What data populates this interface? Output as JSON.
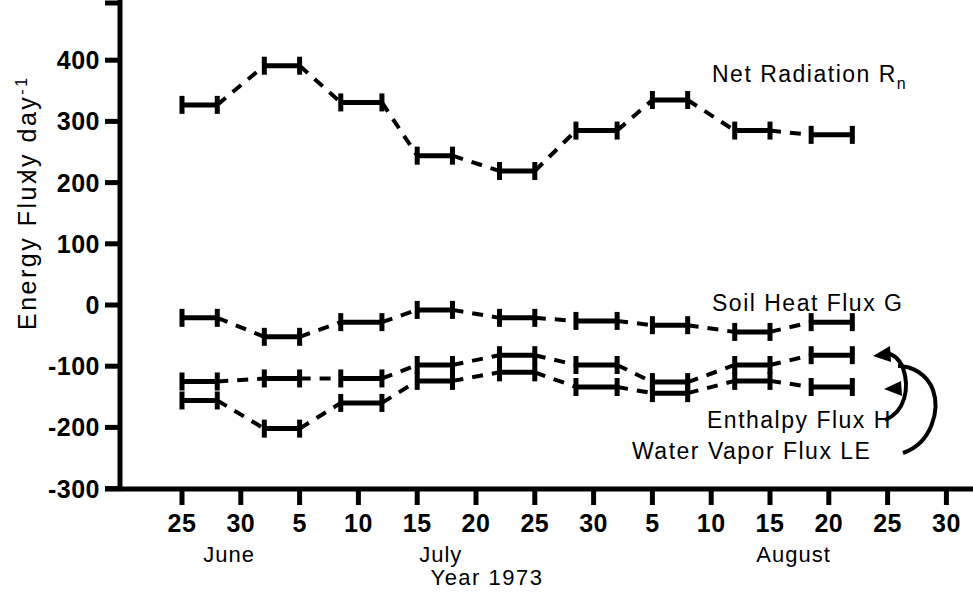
{
  "chart_data": {
    "type": "line",
    "title": "",
    "xlabel": "Year 1973",
    "ylabel": "Energy Flux",
    "yunits_main": "ly  day",
    "yunits_exp": "-1",
    "ylim": [
      -300,
      450
    ],
    "yticks": [
      400,
      300,
      200,
      100,
      0,
      -100,
      -200,
      -300
    ],
    "ytick_labels": [
      "400",
      "300",
      "200",
      "100",
      "0",
      "-100",
      "-200",
      "-300"
    ],
    "xtick_labels": [
      "25",
      "30",
      "5",
      "10",
      "15",
      "20",
      "25",
      "30",
      "5",
      "10",
      "15",
      "20",
      "25",
      "30"
    ],
    "xtick_days": [
      25,
      30,
      35,
      40,
      45,
      50,
      55,
      60,
      65,
      70,
      75,
      80,
      85,
      90
    ],
    "xlim_days": [
      22,
      92
    ],
    "months": [
      {
        "name": "June",
        "center_day": 29
      },
      {
        "name": "July",
        "center_day": 47
      },
      {
        "name": "August",
        "center_day": 77
      }
    ],
    "grid": false,
    "legend_position": "inline-annotations",
    "interval_midpoints": [
      26.5,
      33.5,
      40,
      46.5,
      53.5,
      60,
      66.5,
      73.5,
      80
    ],
    "interval_spans": [
      [
        25,
        28
      ],
      [
        32,
        35
      ],
      [
        38.5,
        42
      ],
      [
        45,
        48
      ],
      [
        52,
        55
      ],
      [
        58.5,
        62
      ],
      [
        65,
        68
      ],
      [
        72,
        75
      ],
      [
        78.5,
        82
      ]
    ],
    "series": [
      {
        "name": "Net Radiation",
        "symbol": "Rn",
        "label": "Net Radiation  R",
        "label_sub": "n",
        "values": [
          327,
          391,
          331,
          244,
          219,
          285,
          335,
          285,
          278
        ]
      },
      {
        "name": "Soil Heat Flux",
        "symbol": "G",
        "label": "Soil  Heat  Flux   G",
        "label_sub": "",
        "values": [
          -21,
          -52,
          -28,
          -8,
          -21,
          -26,
          -33,
          -44,
          -28
        ]
      },
      {
        "name": "Enthalpy Flux",
        "symbol": "H",
        "label": "Enthalpy  Flux   H",
        "label_sub": "",
        "values": [
          -125,
          -120,
          -120,
          -98,
          -82,
          -98,
          -126,
          -98,
          -82
        ]
      },
      {
        "name": "Water Vapor Flux",
        "symbol": "LE",
        "label": "Water Vapor Flux   LE",
        "label_sub": "",
        "values": [
          -156,
          -202,
          -160,
          -124,
          -110,
          -134,
          -144,
          -124,
          -134
        ]
      }
    ]
  },
  "annotations": {
    "net_radiation": "Net Radiation  R",
    "net_radiation_sub": "n",
    "soil_heat_flux": "Soil  Heat  Flux   G",
    "enthalpy_flux": "Enthalpy  Flux   H",
    "water_vapor_flux": "Water Vapor Flux   LE"
  },
  "axis": {
    "y_title": "Energy Flux",
    "y_units": "ly  day",
    "y_units_exp": "-1",
    "x_title": "Year 1973"
  },
  "colors": {
    "ink": "#000000",
    "background": "#ffffff"
  }
}
